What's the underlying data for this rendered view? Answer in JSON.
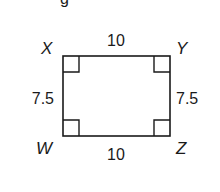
{
  "figure": {
    "partial_text": "g",
    "shape": "rectangle",
    "vertices": {
      "top_left": "X",
      "top_right": "Y",
      "bottom_left": "W",
      "bottom_right": "Z"
    },
    "side_lengths": {
      "top": "10",
      "bottom": "10",
      "left": "7.5",
      "right": "7.5"
    },
    "right_angle_markers": [
      "X",
      "Y",
      "W",
      "Z"
    ],
    "stroke_color": "#1a1a1a"
  }
}
